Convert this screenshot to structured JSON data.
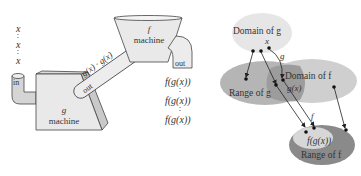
{
  "left_figure": {
    "inputs": [
      "x",
      "x",
      "x"
    ],
    "g_machine": {
      "name": "g",
      "label": "machine",
      "in_label": "in"
    },
    "connector": {
      "in_label": "in",
      "out_label": "out",
      "label": "g(x) · g(x)"
    },
    "f_machine": {
      "name": "f",
      "label": "machine",
      "out_label": "out"
    },
    "outputs": [
      "f(g(x))",
      "f(g(x))",
      "f(g(x))"
    ]
  },
  "right_figure": {
    "domain_g": "Domain of g",
    "range_g": "Range of g",
    "domain_f": "Domain of f",
    "range_f": "Range of f",
    "x_label": "x",
    "g_label": "g",
    "gx_label": "g(x)",
    "f_label": "f",
    "fgx_label": "f(g(x))"
  },
  "colors": {
    "domain_g": "#e6e6e6",
    "range_g": "#b5b5b5",
    "domain_f": "#cfcfcf",
    "overlap": "#9c9c9c",
    "range_f_outer": "#8a8a8a",
    "range_f_inner": "#d7d7d7",
    "machine_fill": "#e9e9e9",
    "stroke": "#444444"
  }
}
